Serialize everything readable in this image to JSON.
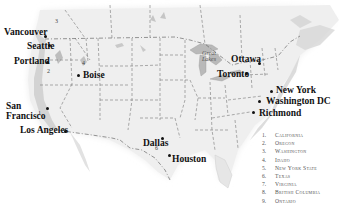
{
  "map": {
    "title": "",
    "cities": [
      {
        "id": "vancouver",
        "name": "Vancouver",
        "x": 5,
        "y": 28,
        "dx": 44,
        "dy": 36
      },
      {
        "id": "seattle",
        "name": "Seattle",
        "x": 27,
        "y": 42,
        "dx": 48,
        "dy": 45
      },
      {
        "id": "portland",
        "name": "Portland",
        "x": 14,
        "y": 57,
        "dx": 46,
        "dy": 62
      },
      {
        "id": "boise",
        "name": "Boise",
        "x": 84,
        "y": 71,
        "dx": 78,
        "dy": 75
      },
      {
        "id": "san-francisco",
        "name": "San\nFrancisco",
        "x": 2,
        "y": 101,
        "dx": 46,
        "dy": 108
      },
      {
        "id": "los-angeles",
        "name": "Los Angeles",
        "x": 21,
        "y": 126,
        "dx": 64,
        "dy": 131
      },
      {
        "id": "dallas",
        "name": "Dallas",
        "x": 142,
        "y": 138,
        "dx": 161,
        "dy": 138
      },
      {
        "id": "houston",
        "name": "Houston",
        "x": 173,
        "y": 155,
        "dx": 168,
        "dy": 155
      },
      {
        "id": "ottawa",
        "name": "Ottawa",
        "x": 232,
        "y": 55,
        "dx": 258,
        "dy": 63
      },
      {
        "id": "toronto",
        "name": "Toronto",
        "x": 218,
        "y": 70,
        "dx": 245,
        "dy": 73
      },
      {
        "id": "new-york",
        "name": "New York",
        "x": 276,
        "y": 86,
        "dx": 270,
        "dy": 91
      },
      {
        "id": "washington-dc",
        "name": "Washington DC",
        "x": 266,
        "y": 96,
        "dx": 260,
        "dy": 101
      },
      {
        "id": "richmond",
        "name": "Richmond",
        "x": 261,
        "y": 108,
        "dx": 255,
        "dy": 112
      }
    ],
    "lake_label": "Great\nLakes",
    "region_numbers": [
      {
        "n": "1",
        "x": 38,
        "y": 112
      },
      {
        "n": "2",
        "x": 47,
        "y": 70
      },
      {
        "n": "3",
        "x": 55,
        "y": 20
      },
      {
        "n": "4",
        "x": 82,
        "y": 62
      },
      {
        "n": "5",
        "x": 268,
        "y": 73
      },
      {
        "n": "6",
        "x": 155,
        "y": 145
      },
      {
        "n": "7",
        "x": 253,
        "y": 112
      },
      {
        "n": "8",
        "x": 30,
        "y": 22
      },
      {
        "n": "9",
        "x": 215,
        "y": 55
      }
    ]
  },
  "legend": {
    "items": [
      {
        "n": "1.",
        "label": "California"
      },
      {
        "n": "2.",
        "label": "Oregon"
      },
      {
        "n": "3.",
        "label": "Washington"
      },
      {
        "n": "4.",
        "label": "Idaho"
      },
      {
        "n": "5.",
        "label": "New York State"
      },
      {
        "n": "6.",
        "label": "Texas"
      },
      {
        "n": "7.",
        "label": "Virginia"
      },
      {
        "n": "8.",
        "label": "British Columbia"
      },
      {
        "n": "9.",
        "label": "Ontario"
      }
    ]
  }
}
